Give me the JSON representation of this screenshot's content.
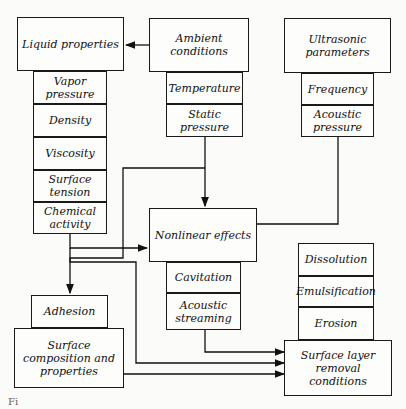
{
  "diagram": {
    "liquid": {
      "title": "Liquid properties",
      "items": [
        "Vapor pressure",
        "Density",
        "Viscosity",
        "Surface tension",
        "Chemical activity"
      ]
    },
    "ambient": {
      "title": "Ambient conditions",
      "items": [
        "Temperature",
        "Static pressure"
      ]
    },
    "ultrasonic": {
      "title": "Ultrasonic parameters",
      "items": [
        "Frequency",
        "Acoustic pressure"
      ]
    },
    "nonlinear": {
      "title": "Nonlinear effects",
      "items": [
        "Cavitation",
        "Acoustic streaming"
      ]
    },
    "surface": {
      "title": "Surface composition and properties",
      "items": [
        "Adhesion"
      ]
    },
    "removal": {
      "title": "Surface layer removal conditions",
      "items": [
        "Dissolution",
        "Emulsification",
        "Erosion"
      ]
    },
    "caption": "Fi"
  }
}
